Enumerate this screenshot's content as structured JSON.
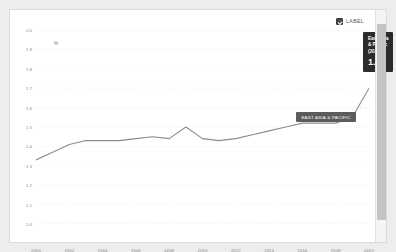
{
  "legend": {
    "label_text": "LABEL",
    "checked": true,
    "checkbox_icon": "checkbox-checked-icon"
  },
  "scrollbar": {
    "icon": "vertical-scrollbar"
  },
  "series_badge": {
    "text": "EAST ASIA & PACIFIC"
  },
  "tooltip": {
    "title": "East Asia & Pacific (2020)",
    "value": "1.7"
  },
  "colors": {
    "line": "#8c8c8c",
    "grid": "#e8e8e8",
    "tooltip_bg": "#2b2b2b",
    "badge_bg": "#5c5c5c",
    "card_bg": "#ffffff",
    "page_bg": "#eceded"
  },
  "chart_data": {
    "type": "line",
    "title": "",
    "xlabel": "",
    "ylabel": "%",
    "ylim": [
      1.0,
      2.0
    ],
    "xlim": [
      2000,
      2020
    ],
    "grid": true,
    "legend_position": "top-right",
    "ytick_labels": [
      "2.0",
      "1.9",
      "1.8",
      "1.7",
      "1.6",
      "1.5",
      "1.4",
      "1.3",
      "1.2",
      "1.1",
      "1.0"
    ],
    "ytick_values": [
      2.0,
      1.9,
      1.8,
      1.7,
      1.6,
      1.5,
      1.4,
      1.3,
      1.2,
      1.1,
      1.0
    ],
    "xtick_labels": [
      "2000",
      "2002",
      "2004",
      "2006",
      "2008",
      "2010",
      "2012",
      "2014",
      "2016",
      "2018",
      "2020"
    ],
    "xtick_values": [
      2000,
      2002,
      2004,
      2006,
      2008,
      2010,
      2012,
      2014,
      2016,
      2018,
      2020
    ],
    "series": [
      {
        "name": "East Asia & Pacific",
        "x": [
          2000,
          2001,
          2002,
          2003,
          2004,
          2005,
          2006,
          2007,
          2008,
          2009,
          2010,
          2011,
          2012,
          2013,
          2014,
          2015,
          2016,
          2017,
          2018,
          2019,
          2020
        ],
        "values": [
          1.33,
          1.37,
          1.41,
          1.43,
          1.43,
          1.43,
          1.44,
          1.45,
          1.44,
          1.5,
          1.44,
          1.43,
          1.44,
          1.46,
          1.48,
          1.5,
          1.52,
          1.52,
          1.52,
          1.55,
          1.7
        ]
      }
    ],
    "annotations": [
      {
        "text": "EAST ASIA & PACIFIC",
        "x": 2016,
        "y": 1.52
      },
      {
        "text": "East Asia & Pacific (2020)",
        "value": "1.7",
        "x": 2020,
        "y": 1.7
      }
    ]
  }
}
